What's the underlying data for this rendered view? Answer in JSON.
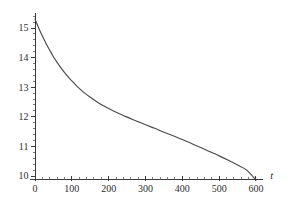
{
  "chart_data": {
    "type": "line",
    "title": "",
    "subtitle": "",
    "xlabel": "t",
    "ylabel": "",
    "xlim": [
      -30,
      625
    ],
    "ylim": [
      9.7,
      15.55
    ],
    "grid": false,
    "legend": null,
    "x_ticks": [
      0,
      100,
      200,
      300,
      400,
      500,
      600
    ],
    "x_tick_labels": [
      "0",
      "100",
      "200",
      "300",
      "400",
      "500",
      "600"
    ],
    "x_minor_step": 20,
    "y_ticks": [
      10,
      11,
      12,
      13,
      14,
      15
    ],
    "y_tick_labels": [
      "10",
      "11",
      "12",
      "13",
      "14",
      "15"
    ],
    "y_minor_step": 0.2,
    "series": [
      {
        "name": "curve",
        "color": "#4a4a4a",
        "x": [
          0,
          10,
          20,
          30,
          40,
          50,
          60,
          75,
          90,
          100,
          115,
          130,
          150,
          175,
          200,
          225,
          250,
          275,
          300,
          325,
          350,
          375,
          400,
          425,
          450,
          475,
          500,
          525,
          550,
          575,
          600
        ],
        "y": [
          15.3,
          15.0,
          14.73,
          14.48,
          14.25,
          14.03,
          13.84,
          13.58,
          13.35,
          13.21,
          13.02,
          12.85,
          12.66,
          12.45,
          12.28,
          12.13,
          11.99,
          11.86,
          11.73,
          11.61,
          11.48,
          11.36,
          11.23,
          11.1,
          10.96,
          10.82,
          10.68,
          10.53,
          10.37,
          10.2,
          9.86
        ]
      }
    ],
    "annotations": []
  },
  "axes": {
    "x_axis_name": "t",
    "y_axis_name": ""
  },
  "colors": {
    "curve": "#4a4a4a",
    "axis": "#3a3a3a",
    "text": "#2e2e2e",
    "background": "#ffffff"
  }
}
